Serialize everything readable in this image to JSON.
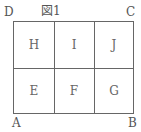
{
  "figure": {
    "caption": "図1"
  },
  "corners": {
    "top_left": "D",
    "top_right": "C",
    "bottom_left": "A",
    "bottom_right": "B"
  },
  "cells": {
    "top": [
      "H",
      "I",
      "J"
    ],
    "bottom": [
      "E",
      "F",
      "G"
    ]
  }
}
